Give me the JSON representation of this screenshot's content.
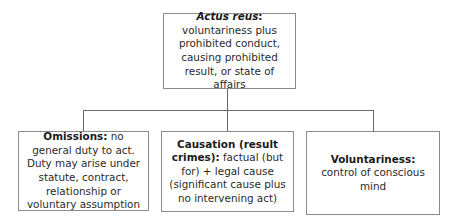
{
  "diagram": {
    "root": {
      "title": "Actus reus",
      "title_suffix": ":",
      "body": "voluntariness plus prohibited conduct, causing prohibited result, or state of affairs"
    },
    "children": [
      {
        "title": "Omissions:",
        "body": " no general duty to act. Duty may arise under statute, contract, relationship or voluntary assumption"
      },
      {
        "title": "Causation (result crimes):",
        "body": "  factual (but for) + legal cause (significant cause plus no intervening act)"
      },
      {
        "title": "Voluntariness:",
        "body": "  control of conscious mind"
      }
    ],
    "colors": {
      "border": "#8a8a8a",
      "connector": "#6a6a6a",
      "text": "#2a2a2a",
      "background": "#ffffff"
    }
  }
}
